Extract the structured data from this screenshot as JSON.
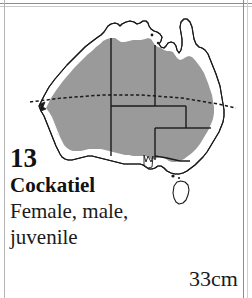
{
  "page": {
    "background_color": "#ffffff",
    "frame_color": "#8d8d8d"
  },
  "caption": {
    "plate_number": "13",
    "species_name": "Cockatiel",
    "plumage_line_1": "Female, male,",
    "plumage_line_2": "juvenile",
    "size": "33cm"
  },
  "map": {
    "name": "australia-distribution-map",
    "region": "Australia",
    "range_fill_color": "#9a9a9a",
    "coastline_color": "#1a1a1a",
    "state_border_color": "#1a1a1a",
    "tropic_line_label": "Tropic of Capricorn",
    "tropic_line_style": "dashed",
    "excluded_areas": [
      "Tasmania",
      "Cape York Peninsula",
      "northern coastal strip",
      "south-west coastal strip",
      "east coastal strip"
    ]
  }
}
